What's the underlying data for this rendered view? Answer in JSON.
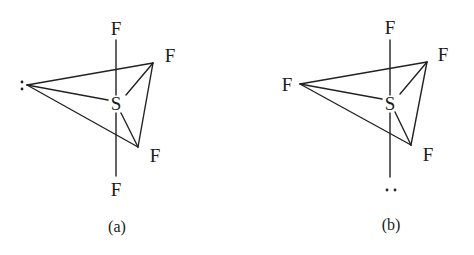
{
  "figure": {
    "panels": [
      {
        "id": "a",
        "caption": "(a)",
        "central_atom": "S",
        "axial_top": "F",
        "axial_bottom": "F",
        "equatorial_right_upper": "F",
        "equatorial_right_lower": "F",
        "equatorial_left": ":",
        "left_is_lone_pair": true
      },
      {
        "id": "b",
        "caption": "(b)",
        "central_atom": "S",
        "axial_top": "F",
        "axial_bottom": "··",
        "equatorial_right_upper": "F",
        "equatorial_right_lower": "F",
        "equatorial_left": "F",
        "bottom_is_lone_pair": true
      }
    ]
  }
}
